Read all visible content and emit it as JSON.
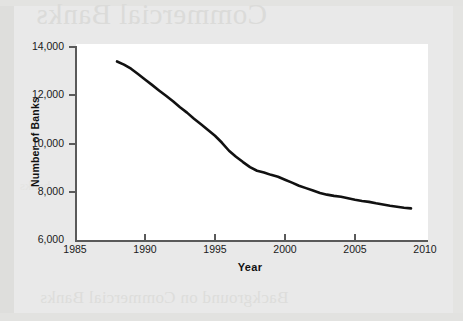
{
  "page": {
    "background_color": "#e9e9e9",
    "plot_background_color": "#ffffff",
    "axis_color": "#5a5a5a",
    "line_color": "#111111",
    "ghost_text": {
      "title": "Commercial Banks",
      "subtitle": "Background on Commercial Banks",
      "faint_a": "Banking",
      "faint_b": "deposits",
      "faint_c": "banks"
    }
  },
  "chart_data": {
    "type": "line",
    "title": "",
    "xlabel": "Year",
    "ylabel": "Number of Banks",
    "xlim": [
      1985,
      2010
    ],
    "ylim": [
      6000,
      14000
    ],
    "xticks": [
      1985,
      1990,
      1995,
      2000,
      2005,
      2010
    ],
    "xticklabels": [
      "1985",
      "1990",
      "1995",
      "2000",
      "2005",
      "2010"
    ],
    "yticks": [
      6000,
      8000,
      10000,
      12000,
      14000
    ],
    "yticklabels": [
      "6,000",
      "8,000",
      "10,000",
      "12,000",
      "14,000"
    ],
    "grid": false,
    "legend": null,
    "series": [
      {
        "name": "Number of Banks",
        "color": "#111111",
        "x": [
          1988,
          1988.5,
          1989,
          1989.5,
          1990,
          1990.5,
          1991,
          1991.5,
          1992,
          1992.5,
          1993,
          1993.5,
          1994,
          1994.5,
          1995,
          1995.5,
          1996,
          1996.5,
          1997,
          1997.5,
          1998,
          1998.5,
          1999,
          1999.5,
          2000,
          2000.5,
          2001,
          2001.5,
          2002,
          2002.5,
          2003,
          2003.5,
          2004,
          2004.5,
          2005,
          2005.5,
          2006,
          2006.5,
          2007,
          2007.5,
          2008,
          2008.5,
          2009
        ],
        "values": [
          13400,
          13270,
          13100,
          12880,
          12650,
          12430,
          12200,
          11980,
          11750,
          11500,
          11280,
          11030,
          10800,
          10560,
          10320,
          10030,
          9700,
          9450,
          9230,
          9020,
          8870,
          8800,
          8700,
          8620,
          8500,
          8380,
          8250,
          8150,
          8050,
          7950,
          7880,
          7830,
          7790,
          7730,
          7670,
          7620,
          7580,
          7520,
          7470,
          7420,
          7380,
          7340,
          7310
        ]
      }
    ]
  }
}
